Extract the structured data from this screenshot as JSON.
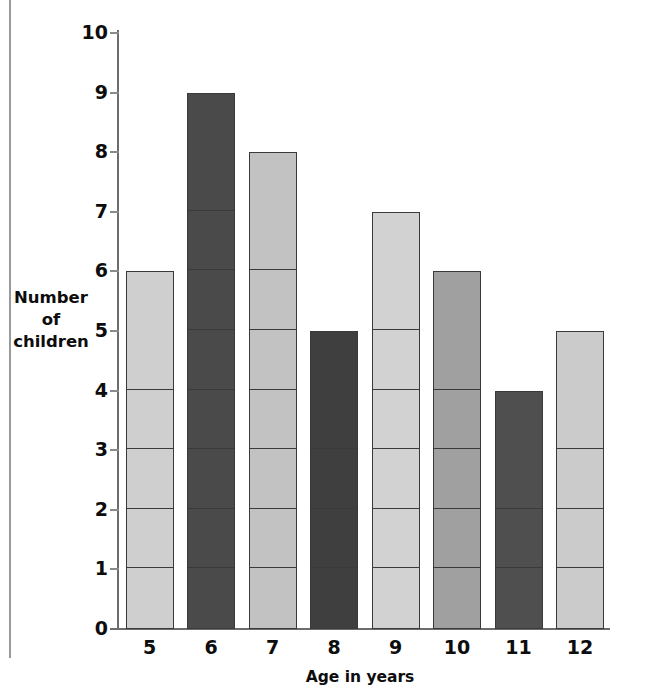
{
  "chart_data": {
    "type": "bar",
    "title": "",
    "xlabel": "Age in years",
    "ylabel": "Number of children",
    "ylabel_lines": [
      "Number",
      "of",
      "children"
    ],
    "categories": [
      "5",
      "6",
      "7",
      "8",
      "9",
      "10",
      "11",
      "12"
    ],
    "values": [
      6,
      9,
      8,
      5,
      7,
      6,
      4,
      5
    ],
    "bar_colors": [
      "#cfcfcf",
      "#4a4a4a",
      "#c2c2c2",
      "#3f3f3f",
      "#d2d2d2",
      "#a0a0a0",
      "#4f4f4f",
      "#cbcbcb"
    ],
    "bar_border_color": "#3a3a3a",
    "segmented_by_unit": true,
    "ylim": [
      0,
      10
    ],
    "y_ticks": [
      "0",
      "1",
      "2",
      "3",
      "4",
      "5",
      "6",
      "7",
      "8",
      "9",
      "10"
    ],
    "y_tick_values": [
      0,
      1,
      2,
      3,
      4,
      5,
      6,
      7,
      8,
      9,
      10
    ],
    "grid": false,
    "legend": "none",
    "axis_color": "#6d6d6d"
  }
}
